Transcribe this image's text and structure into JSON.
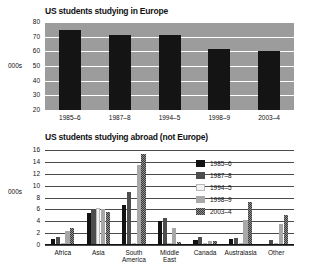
{
  "chart_data": [
    {
      "type": "bar",
      "title": "US students studying in Europe",
      "ylabel": "000s",
      "xlabel": "",
      "categories": [
        "1985–6",
        "1987–8",
        "1994–5",
        "1998–9",
        "2003–4"
      ],
      "values": [
        74.5,
        71.2,
        71.2,
        61.8,
        60.2
      ],
      "yticks": [
        20,
        30,
        40,
        50,
        60,
        70,
        80
      ],
      "ylim": [
        20,
        80
      ],
      "grid": true,
      "legend": "none",
      "bar_color": "#141414",
      "plot_background": "#9c9c9c"
    },
    {
      "type": "bar",
      "title": "US students studying abroad (not Europe)",
      "ylabel": "000s",
      "xlabel": "",
      "categories": [
        "Africa",
        "Asia",
        "South America",
        "Middle East",
        "Canada",
        "Australasia",
        "Other"
      ],
      "yticks": [
        0,
        2,
        4,
        6,
        8,
        10,
        12,
        14,
        16
      ],
      "ylim": [
        0,
        16
      ],
      "grid": true,
      "legend": "inside-top-right",
      "series": [
        {
          "name": "1985–6",
          "color": "#121212",
          "values": [
            1.0,
            5.4,
            6.7,
            4.0,
            0.9,
            1.0,
            0.2
          ]
        },
        {
          "name": "1987–8",
          "color": "#4d4d4d",
          "values": [
            1.3,
            6.0,
            8.9,
            4.5,
            1.3,
            1.2,
            0.8
          ]
        },
        {
          "name": "1994–5",
          "color": "#f2f2f2",
          "values": [
            0.0,
            6.3,
            0.0,
            0.0,
            0.0,
            0.0,
            0.0
          ]
        },
        {
          "name": "1998–9",
          "color": "#a8a8a8",
          "values": [
            2.3,
            6.0,
            13.5,
            2.8,
            0.6,
            4.2,
            3.6
          ]
        },
        {
          "name": "2003–4",
          "color": "#3a3a3a",
          "values": [
            2.8,
            5.6,
            15.3,
            0.5,
            0.6,
            7.2,
            5.1
          ]
        }
      ]
    }
  ]
}
